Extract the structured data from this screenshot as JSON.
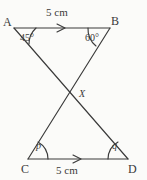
{
  "figure": {
    "background_color": "#fbfbf9",
    "stroke_color": "#3a3a3a",
    "vertices": {
      "A": {
        "label": "A",
        "x": 14,
        "y": 28
      },
      "B": {
        "label": "B",
        "x": 110,
        "y": 28
      },
      "C": {
        "label": "C",
        "x": 28,
        "y": 159
      },
      "D": {
        "label": "D",
        "x": 128,
        "y": 159
      },
      "X": {
        "label": "X",
        "x": 72,
        "y": 95
      }
    },
    "segments": [
      {
        "name": "segment-ab",
        "from": "A",
        "to": "B"
      },
      {
        "name": "segment-cd",
        "from": "C",
        "to": "D"
      },
      {
        "name": "segment-ad",
        "from": "A",
        "to": "D"
      },
      {
        "name": "segment-bc",
        "from": "B",
        "to": "C"
      }
    ],
    "length_labels": [
      {
        "name": "length-ab",
        "text": "5 cm",
        "x": 46,
        "y": 10,
        "for_segment": "segment-ab"
      },
      {
        "name": "length-cd",
        "text": "5 cm",
        "x": 56,
        "y": 166,
        "for_segment": "segment-cd"
      }
    ],
    "tick_marks": [
      {
        "name": "parallel-arrow-ab",
        "on_segment": "segment-ab",
        "glyph": "single-arrowhead",
        "x": 62,
        "y": 28
      },
      {
        "name": "parallel-arrow-cd",
        "on_segment": "segment-cd",
        "glyph": "single-arrowhead",
        "x": 78,
        "y": 159
      }
    ],
    "angles": [
      {
        "name": "angle-at-a",
        "vertex": "A",
        "text": "45°",
        "label_x": 22,
        "label_y": 34,
        "known": true
      },
      {
        "name": "angle-at-b",
        "vertex": "B",
        "text": "60°",
        "label_x": 86,
        "label_y": 34,
        "known": true
      },
      {
        "name": "angle-at-c",
        "vertex": "C",
        "text": "p",
        "label_x": 37,
        "label_y": 146,
        "known": false
      },
      {
        "name": "angle-at-d",
        "vertex": "D",
        "text": "q",
        "label_x": 113,
        "label_y": 146,
        "known": false
      }
    ],
    "intersection_label": {
      "name": "intersection-point-x",
      "text": "X",
      "x": 79,
      "y": 89
    }
  }
}
